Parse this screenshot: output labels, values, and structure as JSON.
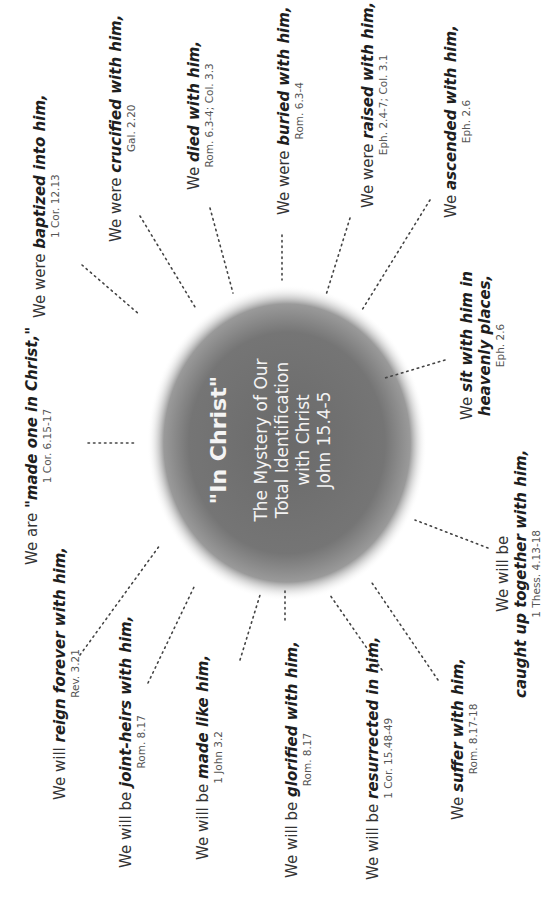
{
  "center": {
    "title": "\"In Christ\"",
    "lines": [
      "The Mystery of Our",
      "Total Identification",
      "with Christ",
      "John 15.4-5"
    ],
    "fill_color": "#6e6e6e"
  },
  "items": [
    {
      "prefix": "We are ",
      "emphasis": "\"made one in Christ,\"",
      "suffix": "",
      "ref": "1 Cor. 6.15-17"
    },
    {
      "prefix": "We were ",
      "emphasis": "baptized into him,",
      "suffix": "",
      "ref": "1 Cor. 12.13"
    },
    {
      "prefix": "We were ",
      "emphasis": "crucified with him,",
      "suffix": "",
      "ref": "Gal. 2.20"
    },
    {
      "prefix": "We ",
      "emphasis": "died with him,",
      "suffix": "",
      "ref": "Rom. 6.3-4; Col. 3.3"
    },
    {
      "prefix": "We were ",
      "emphasis": "buried with him,",
      "suffix": "",
      "ref": "Rom. 6.3-4"
    },
    {
      "prefix": "We were ",
      "emphasis": "raised with him,",
      "suffix": "",
      "ref": "Eph. 2.4-7; Col. 3.1"
    },
    {
      "prefix": "We ",
      "emphasis": "ascended with him,",
      "suffix": "",
      "ref": "Eph. 2.6"
    },
    {
      "prefix": "We ",
      "emphasis": "sit with him in",
      "line2": "heavenly places,",
      "ref": "Eph. 2.6"
    },
    {
      "prefix": "We will be",
      "line2": "caught up together with him,",
      "ref": "1 Thess. 4.13-18"
    },
    {
      "prefix": "We ",
      "emphasis": "suffer with him,",
      "suffix": "",
      "ref": "Rom. 8.17-18"
    },
    {
      "prefix": "We will be ",
      "emphasis": "resurrected in him,",
      "suffix": "",
      "ref": "1 Cor. 15.48-49"
    },
    {
      "prefix": "We will be ",
      "emphasis": "glorified with him,",
      "suffix": "",
      "ref": "Rom. 8.17"
    },
    {
      "prefix": "We will be ",
      "emphasis": "made like him,",
      "suffix": "",
      "ref": "1 John 3.2"
    },
    {
      "prefix": "We will be ",
      "emphasis": "joint-heirs with him,",
      "suffix": "",
      "ref": "Rom. 8.17"
    },
    {
      "prefix": "We will ",
      "emphasis": "reign forever with him,",
      "suffix": "",
      "ref": "Rev. 3.21"
    }
  ]
}
